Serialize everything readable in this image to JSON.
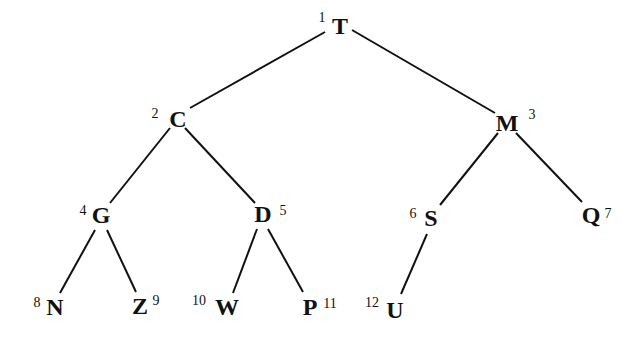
{
  "diagram": {
    "type": "binary-tree",
    "nodes": [
      {
        "id": "n1",
        "label": "T",
        "index": "1",
        "x": 340,
        "y": 34,
        "ix": 322,
        "iy": 22,
        "parent": null
      },
      {
        "id": "n2",
        "label": "C",
        "index": "2",
        "x": 178,
        "y": 127,
        "ix": 155,
        "iy": 118,
        "parent": "n1"
      },
      {
        "id": "n3",
        "label": "M",
        "index": "3",
        "x": 507,
        "y": 131,
        "ix": 532,
        "iy": 119,
        "parent": "n1"
      },
      {
        "id": "n4",
        "label": "G",
        "index": "4",
        "x": 101,
        "y": 223,
        "ix": 83,
        "iy": 215,
        "parent": "n2"
      },
      {
        "id": "n5",
        "label": "D",
        "index": "5",
        "x": 263,
        "y": 222,
        "ix": 283,
        "iy": 215,
        "parent": "n2"
      },
      {
        "id": "n6",
        "label": "S",
        "index": "6",
        "x": 431,
        "y": 226,
        "ix": 413,
        "iy": 218,
        "parent": "n3"
      },
      {
        "id": "n7",
        "label": "Q",
        "index": "7",
        "x": 591,
        "y": 223,
        "ix": 608,
        "iy": 218,
        "parent": "n3"
      },
      {
        "id": "n8",
        "label": "N",
        "index": "8",
        "x": 55,
        "y": 315,
        "ix": 37,
        "iy": 307,
        "parent": "n4"
      },
      {
        "id": "n9",
        "label": "Z",
        "index": "9",
        "x": 140,
        "y": 314,
        "ix": 156,
        "iy": 305,
        "parent": "n4"
      },
      {
        "id": "n10",
        "label": "W",
        "index": "10",
        "x": 227,
        "y": 315,
        "ix": 199,
        "iy": 305,
        "parent": "n5"
      },
      {
        "id": "n11",
        "label": "P",
        "index": "11",
        "x": 310,
        "y": 315,
        "ix": 330,
        "iy": 308,
        "parent": "n5"
      },
      {
        "id": "n12",
        "label": "U",
        "index": "12",
        "x": 395,
        "y": 318,
        "ix": 372,
        "iy": 307,
        "parent": "n6"
      }
    ],
    "edges": [
      {
        "from": "n1",
        "to": "n2",
        "x1": 325,
        "y1": 32,
        "x2": 190,
        "y2": 108
      },
      {
        "from": "n1",
        "to": "n3",
        "x1": 352,
        "y1": 30,
        "x2": 495,
        "y2": 113
      },
      {
        "from": "n2",
        "to": "n4",
        "x1": 170,
        "y1": 128,
        "x2": 110,
        "y2": 203
      },
      {
        "from": "n2",
        "to": "n5",
        "x1": 185,
        "y1": 128,
        "x2": 255,
        "y2": 203
      },
      {
        "from": "n3",
        "to": "n6",
        "x1": 498,
        "y1": 133,
        "x2": 440,
        "y2": 205
      },
      {
        "from": "n3",
        "to": "n7",
        "x1": 516,
        "y1": 133,
        "x2": 582,
        "y2": 202
      },
      {
        "from": "n4",
        "to": "n8",
        "x1": 95,
        "y1": 230,
        "x2": 60,
        "y2": 293
      },
      {
        "from": "n4",
        "to": "n9",
        "x1": 107,
        "y1": 230,
        "x2": 136,
        "y2": 292
      },
      {
        "from": "n5",
        "to": "n10",
        "x1": 257,
        "y1": 229,
        "x2": 233,
        "y2": 293
      },
      {
        "from": "n5",
        "to": "n11",
        "x1": 268,
        "y1": 229,
        "x2": 303,
        "y2": 292
      },
      {
        "from": "n6",
        "to": "n12",
        "x1": 427,
        "y1": 234,
        "x2": 401,
        "y2": 294
      }
    ]
  }
}
